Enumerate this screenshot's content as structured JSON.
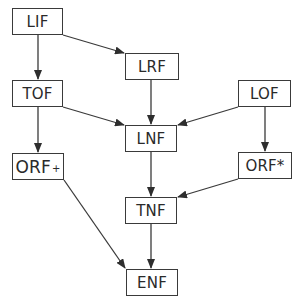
{
  "diagram": {
    "type": "directed-graph",
    "nodes": [
      {
        "id": "LIF",
        "label": "LIF",
        "x": 12,
        "y": 8,
        "w": 51,
        "h": 27
      },
      {
        "id": "LRF",
        "label": "LRF",
        "x": 125,
        "y": 53,
        "w": 54,
        "h": 27
      },
      {
        "id": "TOF",
        "label": "TOF",
        "x": 12,
        "y": 80,
        "w": 51,
        "h": 27
      },
      {
        "id": "LOF",
        "label": "LOF",
        "x": 238,
        "y": 80,
        "w": 53,
        "h": 27
      },
      {
        "id": "LNF",
        "label": "LNF",
        "x": 125,
        "y": 125,
        "w": 52,
        "h": 27
      },
      {
        "id": "ORF_plus",
        "label": "ORF",
        "suffix": "+",
        "x": 12,
        "y": 153,
        "w": 52,
        "h": 27
      },
      {
        "id": "ORF_star",
        "label": "ORF*",
        "x": 238,
        "y": 152,
        "w": 54,
        "h": 27
      },
      {
        "id": "TNF",
        "label": "TNF",
        "x": 125,
        "y": 197,
        "w": 52,
        "h": 27
      },
      {
        "id": "ENF",
        "label": "ENF",
        "x": 126,
        "y": 269,
        "w": 52,
        "h": 27
      }
    ],
    "edges": [
      {
        "from": "LIF",
        "to": "LRF"
      },
      {
        "from": "LIF",
        "to": "TOF"
      },
      {
        "from": "TOF",
        "to": "LNF"
      },
      {
        "from": "TOF",
        "to": "ORF_plus"
      },
      {
        "from": "LRF",
        "to": "LNF"
      },
      {
        "from": "LOF",
        "to": "LNF"
      },
      {
        "from": "LOF",
        "to": "ORF_star"
      },
      {
        "from": "LNF",
        "to": "TNF"
      },
      {
        "from": "ORF_star",
        "to": "TNF"
      },
      {
        "from": "TNF",
        "to": "ENF"
      },
      {
        "from": "ORF_plus",
        "to": "ENF"
      }
    ],
    "colors": {
      "stroke": "#3a3a3a",
      "text": "#2a2a2a",
      "background": "#ffffff"
    }
  }
}
